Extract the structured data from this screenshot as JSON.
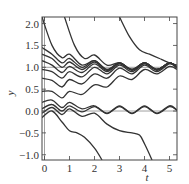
{
  "chart_data": {
    "type": "line",
    "title": "",
    "xlabel": "t",
    "ylabel": "y",
    "xlim": [
      -0.1,
      5.3
    ],
    "ylim": [
      -1.12,
      2.15
    ],
    "xticks": [
      0,
      1,
      2,
      3,
      4,
      5
    ],
    "xtick_labels": [
      "0",
      "1",
      "2",
      "3",
      "4",
      "5"
    ],
    "yticks": [
      -1.0,
      -0.5,
      0.0,
      0.5,
      1.0,
      1.5,
      2.0
    ],
    "ytick_labels": [
      "−1.0",
      "−0.5",
      "0.0",
      "0.5",
      "1.0",
      "1.5",
      "2.0"
    ],
    "reference_lines": {
      "horizontal": [
        0.0,
        1.0
      ],
      "vertical": [
        0
      ]
    },
    "grid": false,
    "legend": "none",
    "line_color": "#333333",
    "reference_color": "#888888",
    "series": [
      {
        "name": "s1",
        "points": [
          [
            -0.1,
            2.15
          ],
          [
            0.3,
            1.5
          ],
          [
            0.7,
            1.22
          ],
          [
            1.0,
            1.3
          ],
          [
            1.5,
            1.05
          ],
          [
            2.0,
            1.15
          ],
          [
            2.5,
            0.95
          ],
          [
            3.0,
            1.1
          ],
          [
            3.5,
            0.95
          ],
          [
            4.0,
            1.1
          ],
          [
            4.5,
            0.95
          ],
          [
            5.0,
            1.1
          ],
          [
            5.3,
            1.0
          ]
        ]
      },
      {
        "name": "s2",
        "points": [
          [
            -0.1,
            1.45
          ],
          [
            0.3,
            1.3
          ],
          [
            0.7,
            1.1
          ],
          [
            1.0,
            1.2
          ],
          [
            1.5,
            1.0
          ],
          [
            2.0,
            1.15
          ],
          [
            2.5,
            0.95
          ],
          [
            3.0,
            1.1
          ],
          [
            3.5,
            0.95
          ],
          [
            4.0,
            1.1
          ],
          [
            4.5,
            0.95
          ],
          [
            5.0,
            1.1
          ],
          [
            5.3,
            1.0
          ]
        ]
      },
      {
        "name": "s3",
        "points": [
          [
            -0.1,
            1.3
          ],
          [
            0.3,
            1.2
          ],
          [
            0.7,
            1.0
          ],
          [
            1.0,
            1.12
          ],
          [
            1.5,
            0.95
          ],
          [
            2.0,
            1.12
          ],
          [
            2.5,
            0.93
          ],
          [
            3.0,
            1.1
          ],
          [
            3.5,
            0.95
          ],
          [
            4.0,
            1.1
          ],
          [
            4.5,
            0.95
          ],
          [
            5.0,
            1.1
          ],
          [
            5.3,
            1.0
          ]
        ]
      },
      {
        "name": "s4",
        "points": [
          [
            -0.1,
            1.15
          ],
          [
            0.3,
            1.05
          ],
          [
            0.7,
            0.88
          ],
          [
            1.0,
            1.02
          ],
          [
            1.5,
            0.88
          ],
          [
            2.0,
            1.08
          ],
          [
            2.5,
            0.9
          ],
          [
            3.0,
            1.08
          ],
          [
            3.5,
            0.93
          ],
          [
            4.0,
            1.1
          ],
          [
            4.5,
            0.95
          ],
          [
            5.0,
            1.1
          ],
          [
            5.3,
            1.0
          ]
        ]
      },
      {
        "name": "s5",
        "points": [
          [
            -0.1,
            0.95
          ],
          [
            0.3,
            0.9
          ],
          [
            0.7,
            0.75
          ],
          [
            1.0,
            0.9
          ],
          [
            1.5,
            0.78
          ],
          [
            2.0,
            1.0
          ],
          [
            2.5,
            0.85
          ],
          [
            3.0,
            1.05
          ],
          [
            3.5,
            0.9
          ],
          [
            4.0,
            1.08
          ],
          [
            4.5,
            0.93
          ],
          [
            5.0,
            1.1
          ],
          [
            5.3,
            1.0
          ]
        ]
      },
      {
        "name": "s6",
        "points": [
          [
            -0.1,
            0.75
          ],
          [
            0.3,
            0.7
          ],
          [
            0.7,
            0.55
          ],
          [
            1.0,
            0.72
          ],
          [
            1.5,
            0.62
          ],
          [
            2.0,
            0.85
          ],
          [
            2.5,
            0.75
          ],
          [
            3.0,
            0.98
          ],
          [
            3.5,
            0.85
          ],
          [
            4.0,
            1.05
          ],
          [
            4.5,
            0.9
          ],
          [
            5.0,
            1.08
          ],
          [
            5.3,
            0.98
          ]
        ]
      },
      {
        "name": "s7",
        "points": [
          [
            -0.1,
            0.45
          ],
          [
            0.3,
            0.45
          ],
          [
            0.7,
            0.3
          ],
          [
            1.0,
            0.45
          ],
          [
            1.5,
            0.38
          ],
          [
            2.0,
            0.6
          ],
          [
            2.5,
            0.55
          ],
          [
            3.0,
            0.8
          ],
          [
            3.5,
            0.72
          ],
          [
            4.0,
            0.95
          ],
          [
            4.5,
            0.85
          ],
          [
            5.0,
            1.02
          ],
          [
            5.3,
            0.95
          ]
        ]
      },
      {
        "name": "s8",
        "points": [
          [
            -0.1,
            0.2
          ],
          [
            0.3,
            0.25
          ],
          [
            0.7,
            0.08
          ],
          [
            1.0,
            0.2
          ],
          [
            1.5,
            0.05
          ],
          [
            2.0,
            0.12
          ],
          [
            2.5,
            -0.05
          ],
          [
            3.0,
            0.12
          ],
          [
            3.5,
            -0.05
          ],
          [
            4.0,
            0.12
          ],
          [
            4.5,
            -0.05
          ],
          [
            5.0,
            0.12
          ],
          [
            5.3,
            0.02
          ]
        ]
      },
      {
        "name": "s9",
        "points": [
          [
            -0.1,
            0.05
          ],
          [
            0.3,
            0.15
          ],
          [
            0.7,
            0.0
          ],
          [
            1.0,
            0.12
          ],
          [
            1.5,
            -0.02
          ],
          [
            2.0,
            0.1
          ],
          [
            2.5,
            -0.06
          ],
          [
            3.0,
            0.1
          ],
          [
            3.5,
            -0.06
          ],
          [
            4.0,
            0.1
          ],
          [
            4.5,
            -0.06
          ],
          [
            5.0,
            0.1
          ],
          [
            5.3,
            0.02
          ]
        ]
      },
      {
        "name": "s10",
        "points": [
          [
            -0.1,
            -0.05
          ],
          [
            0.3,
            0.08
          ],
          [
            0.7,
            -0.08
          ],
          [
            1.0,
            0.05
          ],
          [
            1.5,
            -0.12
          ],
          [
            2.0,
            -0.05
          ],
          [
            2.5,
            -0.3
          ],
          [
            3.0,
            -0.45
          ],
          [
            3.5,
            -0.5
          ],
          [
            3.8,
            -0.55
          ],
          [
            4.0,
            -0.75
          ],
          [
            4.3,
            -1.12
          ]
        ]
      },
      {
        "name": "s11",
        "points": [
          [
            -0.1,
            -0.15
          ],
          [
            0.3,
            0.0
          ],
          [
            0.7,
            -0.25
          ],
          [
            1.0,
            -0.45
          ],
          [
            1.3,
            -0.5
          ],
          [
            1.6,
            -0.6
          ],
          [
            2.0,
            -0.85
          ],
          [
            2.3,
            -1.12
          ]
        ]
      },
      {
        "name": "s12",
        "points": [
          [
            0.8,
            2.15
          ],
          [
            1.2,
            1.5
          ],
          [
            1.6,
            1.2
          ],
          [
            2.0,
            1.28
          ],
          [
            2.5,
            1.05
          ],
          [
            3.0,
            1.1
          ],
          [
            3.5,
            0.95
          ],
          [
            4.0,
            1.1
          ],
          [
            4.5,
            0.95
          ],
          [
            5.0,
            1.1
          ],
          [
            5.3,
            1.0
          ]
        ]
      },
      {
        "name": "s13",
        "points": [
          [
            3.0,
            2.15
          ],
          [
            3.4,
            1.7
          ],
          [
            3.8,
            1.4
          ],
          [
            4.2,
            1.3
          ],
          [
            4.6,
            1.2
          ],
          [
            5.0,
            1.1
          ],
          [
            5.3,
            1.05
          ]
        ]
      }
    ]
  }
}
